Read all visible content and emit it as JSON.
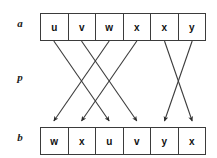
{
  "figure": {
    "labels": {
      "source_row": "a",
      "permutation_row": "p",
      "target_row": "b"
    },
    "source_array": {
      "name": "a",
      "cells": [
        "u",
        "v",
        "w",
        "x",
        "x",
        "y"
      ]
    },
    "target_array": {
      "name": "b",
      "cells": [
        "w",
        "x",
        "u",
        "v",
        "y",
        "x"
      ]
    },
    "permutation": {
      "name": "p",
      "description": "mapping from a indices to b indices",
      "mapping": [
        {
          "from_index": 0,
          "from_value": "u",
          "to_index": 2,
          "to_value": "u"
        },
        {
          "from_index": 1,
          "from_value": "v",
          "to_index": 3,
          "to_value": "v"
        },
        {
          "from_index": 2,
          "from_value": "w",
          "to_index": 0,
          "to_value": "w"
        },
        {
          "from_index": 3,
          "from_value": "x",
          "to_index": 1,
          "to_value": "x"
        },
        {
          "from_index": 4,
          "from_value": "x",
          "to_index": 5,
          "to_value": "x"
        },
        {
          "from_index": 5,
          "from_value": "y",
          "to_index": 4,
          "to_value": "y"
        }
      ]
    },
    "colors": {
      "box_border": "#3b3b3b",
      "arrow": "#3b3b3b",
      "text": "#111111",
      "background": "#ffffff"
    }
  }
}
